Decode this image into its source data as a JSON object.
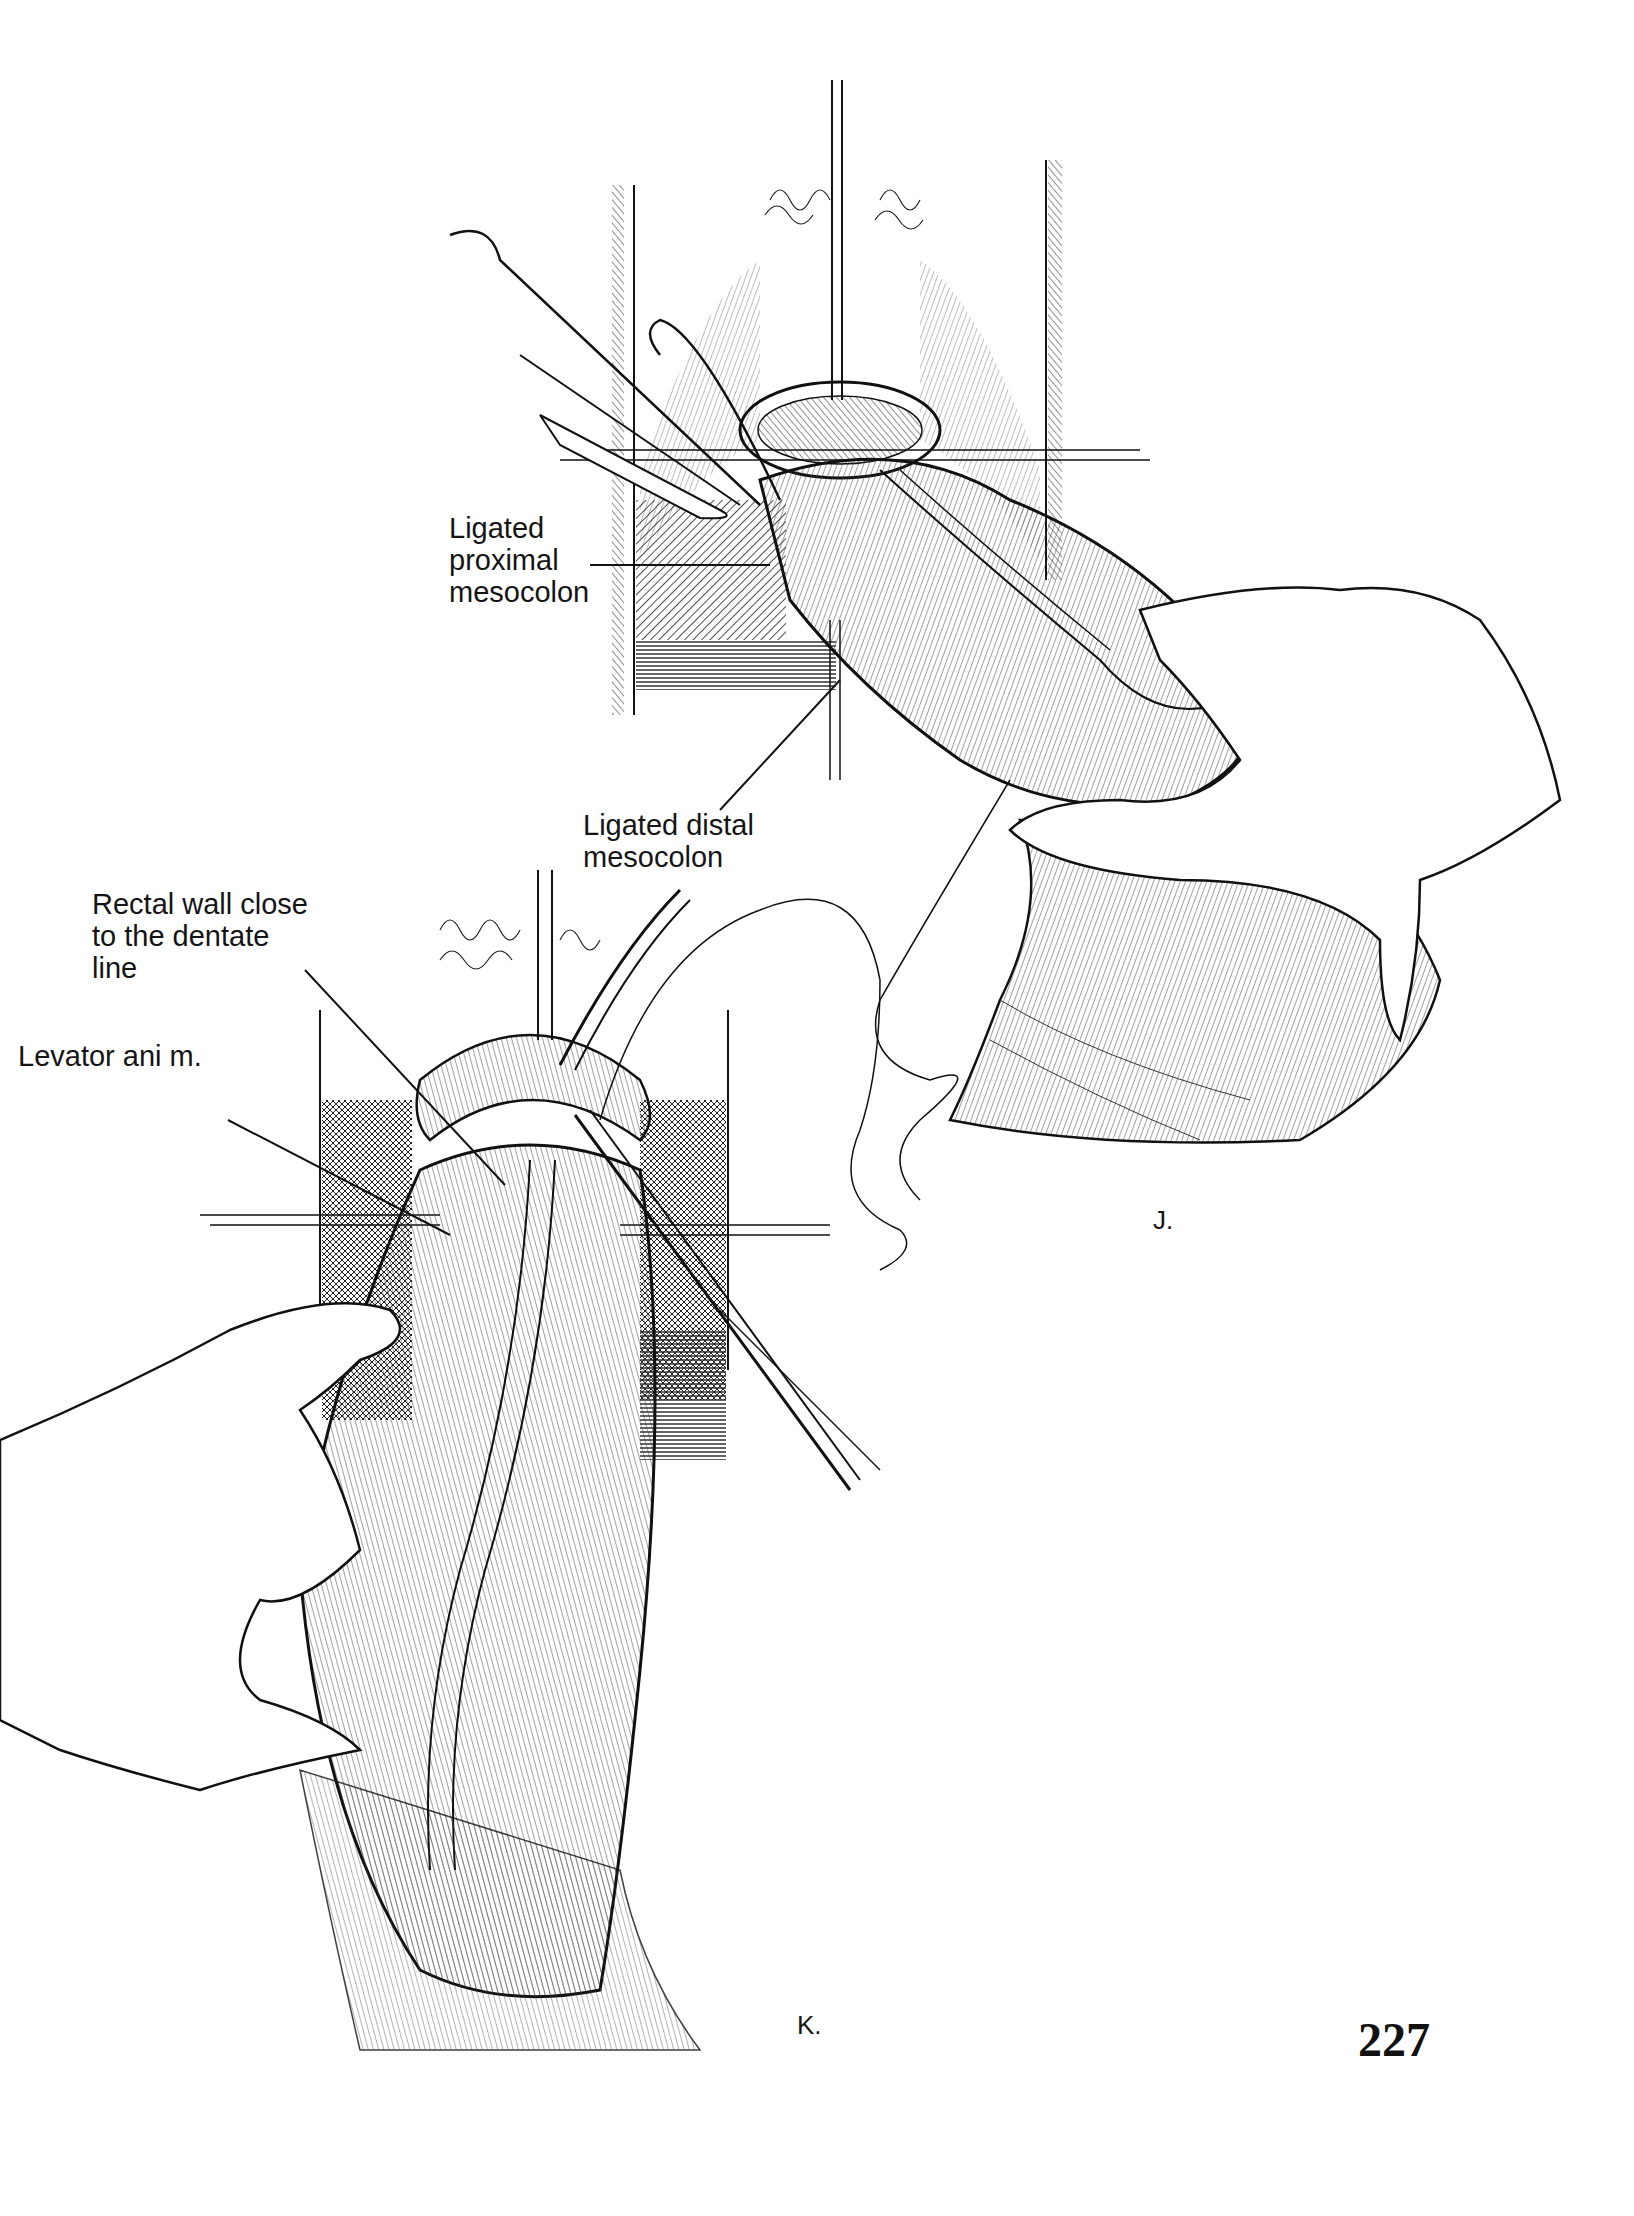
{
  "page": {
    "number": "227"
  },
  "figures": [
    {
      "id": "J",
      "panel_label": "J.",
      "description": "Operative illustration: colon pulled through the anus with hand retracting; sutured retraction at perineum",
      "callouts": [
        {
          "text": "Ligated\nproximal\nmesocolon"
        },
        {
          "text": "Ligated distal\nmesocolon"
        }
      ]
    },
    {
      "id": "K",
      "panel_label": "K.",
      "description": "Operative illustration: exteriorized colon held by hand; clamp and suture near the dentate line",
      "callouts": [
        {
          "text": "Rectal wall close\nto the dentate\nline"
        },
        {
          "text": "Levator ani m."
        }
      ]
    }
  ],
  "colors": {
    "ink": "#151515",
    "paper": "#ffffff",
    "hatch": "#333333"
  }
}
